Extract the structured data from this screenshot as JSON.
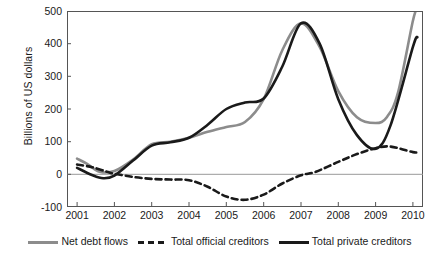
{
  "chart_data": {
    "type": "line",
    "title": "",
    "xlabel": "",
    "ylabel": "Billions of US dollars",
    "xlim": [
      2000.73,
      2010.27
    ],
    "ylim": [
      -100,
      500
    ],
    "yticks": [
      500,
      400,
      300,
      200,
      100,
      0,
      -100
    ],
    "ytick_labels": [
      "500",
      "400",
      "300",
      "200",
      "100",
      "0",
      "-100"
    ],
    "xticks": [
      2001,
      2002,
      2003,
      2004,
      2005,
      2006,
      2007,
      2008,
      2009,
      2010
    ],
    "xtick_labels": [
      "2001",
      "2002",
      "2003",
      "2004",
      "2005",
      "2006",
      "2007",
      "2008",
      "2009",
      "2010"
    ],
    "grid": false,
    "zero_line": true,
    "legend_position": "bottom",
    "colors": {
      "net_debt_flows": "#8c8c8c",
      "total_official_creditors": "#1a1a1a",
      "total_private_creditors": "#1a1a1a",
      "axis": "#555555",
      "zero_line": "#999999",
      "background": "#ffffff"
    },
    "series": [
      {
        "name": "Net debt flows",
        "style": "solid",
        "color": "#8c8c8c",
        "x": [
          2001,
          2001.3,
          2001.6,
          2002,
          2002.5,
          2003,
          2003.5,
          2004,
          2004.5,
          2005,
          2005.5,
          2006,
          2006.5,
          2007,
          2007.5,
          2008,
          2008.5,
          2009,
          2009.3,
          2009.6,
          2010,
          2010.12
        ],
        "values": [
          48,
          30,
          8,
          10,
          45,
          92,
          100,
          112,
          130,
          145,
          160,
          230,
          380,
          462,
          390,
          255,
          175,
          157,
          175,
          250,
          470,
          510
        ]
      },
      {
        "name": "Total official creditors",
        "style": "dashed",
        "color": "#1a1a1a",
        "x": [
          2001,
          2001.4,
          2001.8,
          2002,
          2002.5,
          2003,
          2003.5,
          2004,
          2004.5,
          2005,
          2005.5,
          2006,
          2006.5,
          2007,
          2007.4,
          2008,
          2008.5,
          2009,
          2009.4,
          2010,
          2010.12
        ],
        "values": [
          30,
          22,
          8,
          2,
          -8,
          -14,
          -16,
          -18,
          -38,
          -68,
          -78,
          -62,
          -28,
          -3,
          8,
          38,
          62,
          80,
          85,
          68,
          68
        ]
      },
      {
        "name": "Total private creditors",
        "style": "solid",
        "color": "#1a1a1a",
        "x": [
          2001,
          2001.4,
          2001.7,
          2002,
          2002.5,
          2003,
          2003.5,
          2004,
          2004.5,
          2005,
          2005.5,
          2006,
          2006.5,
          2007,
          2007.5,
          2008,
          2008.5,
          2009,
          2009.4,
          2010,
          2010.12
        ],
        "values": [
          20,
          -2,
          -12,
          -4,
          42,
          88,
          98,
          112,
          152,
          200,
          220,
          232,
          330,
          462,
          400,
          230,
          120,
          78,
          150,
          390,
          420
        ]
      }
    ]
  },
  "axis": {
    "ylabel": "Billions of US dollars"
  },
  "legend": {
    "items": [
      {
        "label": "Net debt flows",
        "icon": "line-solid-gray-icon"
      },
      {
        "label": "Total official creditors",
        "icon": "line-dashed-black-icon"
      },
      {
        "label": "Total private creditors",
        "icon": "line-solid-black-icon"
      }
    ]
  }
}
